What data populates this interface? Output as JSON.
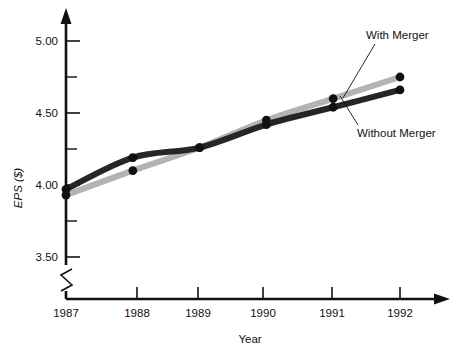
{
  "chart_data": {
    "type": "line",
    "title": "",
    "xlabel": "Year",
    "ylabel": "EPS ($)",
    "x": [
      1987,
      1988,
      1989,
      1990,
      1991,
      1992
    ],
    "categories": [
      "1987",
      "1988",
      "1989",
      "1990",
      "1991",
      "1992"
    ],
    "xtick_labels": [
      "1987",
      "1988",
      "1989",
      "1990",
      "1991",
      "1992"
    ],
    "ytick_labels": [
      "3.50",
      "4.00",
      "4.50",
      "5.00"
    ],
    "ytick_values": [
      3.5,
      4.0,
      4.5,
      5.0
    ],
    "yminor_values": [
      3.75,
      4.25,
      4.75,
      5.25
    ],
    "ylim": [
      3.4,
      5.25
    ],
    "xlim": [
      1986.85,
      1992.55
    ],
    "grid": false,
    "legend_position": "inline-annotations",
    "y_axis_break": true,
    "series": [
      {
        "name": "With Merger",
        "color": "#b3b3b3",
        "values": [
          3.93,
          4.1,
          4.26,
          4.45,
          4.6,
          4.75
        ]
      },
      {
        "name": "Without Merger",
        "color": "#262626",
        "values": [
          3.97,
          4.19,
          4.26,
          4.42,
          4.54,
          4.66
        ]
      }
    ],
    "annotations": [
      {
        "text": "With Merger",
        "series": "With Merger"
      },
      {
        "text": "Without Merger",
        "series": "Without Merger"
      }
    ]
  },
  "axes": {
    "y_title": "EPS ($)",
    "x_title": "Year",
    "y_labels": {
      "l0": "5.00",
      "l1": "4.50",
      "l2": "4.00",
      "l3": "3.50"
    },
    "x_labels": {
      "x0": "1987",
      "x1": "1988",
      "x2": "1989",
      "x3": "1990",
      "x4": "1991",
      "x5": "1992"
    }
  },
  "annotations": {
    "with_merger": "With Merger",
    "without_merger": "Without Merger"
  },
  "colors": {
    "with_merger": "#b3b3b3",
    "without_merger": "#262626",
    "axis": "#111111",
    "background": "#ffffff"
  }
}
